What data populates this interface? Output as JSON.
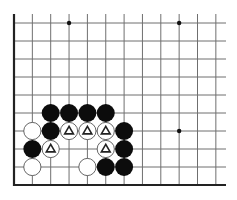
{
  "diagram": {
    "type": "go-board-fragment",
    "visible_columns": 12,
    "visible_rows": 10,
    "edges": [
      "left",
      "bottom"
    ],
    "colors": {
      "background": "#ffffff",
      "grid_line": "#6f6f6f",
      "edge_line": "#222222",
      "black_stone": "#0c0c0c",
      "white_stone_fill": "#ffffff",
      "white_stone_stroke": "#555555",
      "triangle_mark": "#222222",
      "hoshi": "#111111"
    },
    "hoshi": [
      {
        "col": 3,
        "row": 0
      },
      {
        "col": 9,
        "row": 0
      },
      {
        "col": 9,
        "row": 6
      }
    ],
    "stones": [
      {
        "color": "black",
        "col": 2,
        "row": 5
      },
      {
        "color": "black",
        "col": 3,
        "row": 5
      },
      {
        "color": "black",
        "col": 4,
        "row": 5
      },
      {
        "color": "black",
        "col": 5,
        "row": 5
      },
      {
        "color": "white",
        "col": 1,
        "row": 6
      },
      {
        "color": "black",
        "col": 2,
        "row": 6
      },
      {
        "color": "white",
        "col": 3,
        "row": 6,
        "mark": "triangle"
      },
      {
        "color": "white",
        "col": 4,
        "row": 6,
        "mark": "triangle"
      },
      {
        "color": "white",
        "col": 5,
        "row": 6,
        "mark": "triangle"
      },
      {
        "color": "black",
        "col": 6,
        "row": 6
      },
      {
        "color": "black",
        "col": 1,
        "row": 7
      },
      {
        "color": "white",
        "col": 2,
        "row": 7,
        "mark": "triangle"
      },
      {
        "color": "white",
        "col": 5,
        "row": 7,
        "mark": "triangle"
      },
      {
        "color": "black",
        "col": 6,
        "row": 7
      },
      {
        "color": "white",
        "col": 1,
        "row": 8
      },
      {
        "color": "white",
        "col": 4,
        "row": 8
      },
      {
        "color": "black",
        "col": 5,
        "row": 8
      },
      {
        "color": "black",
        "col": 6,
        "row": 8
      }
    ]
  }
}
